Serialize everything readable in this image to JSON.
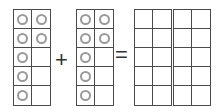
{
  "equation": {
    "operator_plus": "+",
    "operator_equals": "="
  },
  "frames": [
    {
      "name": "addend-1-ten-frame",
      "left": 13,
      "counters": [
        [
          1,
          1
        ],
        [
          1,
          1
        ],
        [
          1,
          0
        ],
        [
          1,
          0
        ],
        [
          1,
          0
        ]
      ],
      "count": 7
    },
    {
      "name": "addend-2-ten-frame",
      "left": 76,
      "counters": [
        [
          1,
          1
        ],
        [
          1,
          1
        ],
        [
          1,
          0
        ],
        [
          1,
          0
        ],
        [
          1,
          0
        ]
      ],
      "count": 7
    },
    {
      "name": "sum-ten-frame-1",
      "left": 134,
      "counters": [
        [
          0,
          0
        ],
        [
          0,
          0
        ],
        [
          0,
          0
        ],
        [
          0,
          0
        ],
        [
          0,
          0
        ]
      ],
      "count": 0
    },
    {
      "name": "sum-ten-frame-2",
      "left": 173,
      "counters": [
        [
          0,
          0
        ],
        [
          0,
          0
        ],
        [
          0,
          0
        ],
        [
          0,
          0
        ],
        [
          0,
          0
        ]
      ],
      "count": 0
    }
  ],
  "colors": {
    "grid_line": "#4a4a4a",
    "counter_ring": "#9a9a9a",
    "operator": "#333333"
  }
}
